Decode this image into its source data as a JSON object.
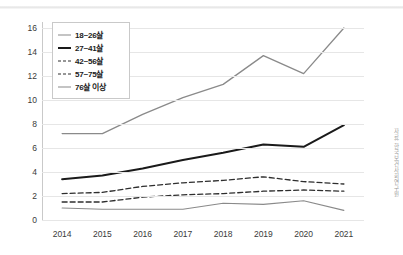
{
  "chart_data": {
    "type": "line",
    "title": "",
    "xlabel": "",
    "ylabel": "",
    "categories": [
      "2014",
      "2015",
      "2016",
      "2017",
      "2018",
      "2019",
      "2020",
      "2021"
    ],
    "ylim": [
      0,
      16
    ],
    "ytick_step": 2,
    "yticks": [
      "16",
      "14",
      "12",
      "10",
      "8",
      "6",
      "4",
      "2",
      "0"
    ],
    "grid": true,
    "legend_position": "top-left",
    "series": [
      {
        "name": "18~26살",
        "style": "solid",
        "color": "#8a8a8a",
        "width": 1.3,
        "values": [
          7.2,
          7.2,
          8.8,
          10.2,
          11.3,
          13.7,
          12.2,
          16.0
        ]
      },
      {
        "name": "27~41살",
        "style": "solid",
        "color": "#1a1a1a",
        "width": 2.0,
        "values": [
          3.4,
          3.7,
          4.3,
          5.0,
          5.6,
          6.3,
          6.1,
          7.9
        ]
      },
      {
        "name": "42~56살",
        "style": "dashed",
        "color": "#2e2e2e",
        "width": 1.3,
        "values": [
          2.2,
          2.3,
          2.8,
          3.1,
          3.3,
          3.6,
          3.2,
          3.0
        ]
      },
      {
        "name": "57~75살",
        "style": "dashed",
        "color": "#2e2e2e",
        "width": 1.3,
        "values": [
          1.5,
          1.5,
          1.9,
          2.1,
          2.2,
          2.4,
          2.5,
          2.4
        ]
      },
      {
        "name": "76살 이상",
        "style": "solid",
        "color": "#8a8a8a",
        "width": 1.1,
        "values": [
          1.0,
          0.9,
          0.9,
          0.9,
          1.4,
          1.3,
          1.6,
          0.8
        ]
      }
    ]
  },
  "side_note": {
    "text": "자료: 한국보건사회연구원"
  }
}
